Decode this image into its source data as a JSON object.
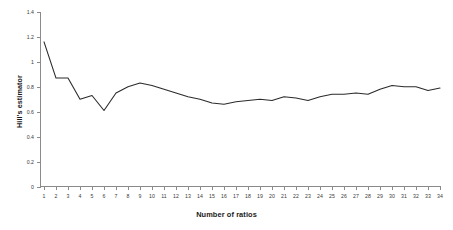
{
  "chart_data": {
    "type": "line",
    "title": "",
    "xlabel": "Number of ratios",
    "ylabel": "Hill's estimator",
    "x": [
      1,
      2,
      3,
      4,
      5,
      6,
      7,
      8,
      9,
      10,
      11,
      12,
      13,
      14,
      15,
      16,
      17,
      18,
      19,
      20,
      21,
      22,
      23,
      24,
      25,
      26,
      27,
      28,
      29,
      30,
      31,
      32,
      33,
      34
    ],
    "values": [
      1.16,
      0.87,
      0.87,
      0.7,
      0.73,
      0.61,
      0.75,
      0.8,
      0.83,
      0.81,
      0.78,
      0.75,
      0.72,
      0.7,
      0.67,
      0.66,
      0.68,
      0.69,
      0.7,
      0.69,
      0.72,
      0.71,
      0.69,
      0.72,
      0.74,
      0.74,
      0.75,
      0.74,
      0.78,
      0.81,
      0.8,
      0.8,
      0.77,
      0.79
    ],
    "series": [
      {
        "name": "Hill's estimator",
        "values": [
          1.16,
          0.87,
          0.87,
          0.7,
          0.73,
          0.61,
          0.75,
          0.8,
          0.83,
          0.81,
          0.78,
          0.75,
          0.72,
          0.7,
          0.67,
          0.66,
          0.68,
          0.69,
          0.7,
          0.69,
          0.72,
          0.71,
          0.69,
          0.72,
          0.74,
          0.74,
          0.75,
          0.74,
          0.78,
          0.81,
          0.8,
          0.8,
          0.77,
          0.79
        ],
        "color": "#2b2b2b"
      }
    ],
    "xlim": [
      1,
      34
    ],
    "ylim": [
      0,
      1.4
    ],
    "ytick_labels": [
      "0",
      "0.2",
      "0.4",
      "0.6",
      "0.8",
      "1",
      "1.2",
      "1.4"
    ],
    "ytick_values": [
      0,
      0.2,
      0.4,
      0.6,
      0.8,
      1.0,
      1.2,
      1.4
    ],
    "xtick_labels": [
      "1",
      "2",
      "3",
      "4",
      "5",
      "6",
      "7",
      "8",
      "9",
      "10",
      "11",
      "12",
      "13",
      "14",
      "15",
      "16",
      "17",
      "18",
      "19",
      "20",
      "21",
      "22",
      "23",
      "24",
      "25",
      "26",
      "27",
      "28",
      "29",
      "30",
      "31",
      "32",
      "33",
      "34"
    ],
    "grid": false,
    "legend": false,
    "axis_color": "#8a8a8a",
    "line_color": "#2b2b2b",
    "background": "#ffffff"
  }
}
